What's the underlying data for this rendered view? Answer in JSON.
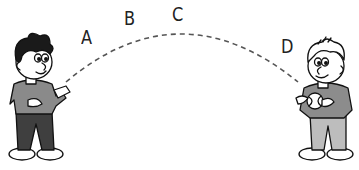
{
  "diagram": {
    "type": "trajectory-illustration",
    "labels": [
      {
        "id": "A",
        "text": "A",
        "x": 81,
        "y": 28
      },
      {
        "id": "B",
        "text": "B",
        "x": 124,
        "y": 9
      },
      {
        "id": "C",
        "text": "C",
        "x": 172,
        "y": 5
      },
      {
        "id": "D",
        "text": "D",
        "x": 281,
        "y": 37
      }
    ],
    "trajectory": {
      "style": "dashed",
      "color": "#555555",
      "start": [
        66,
        82
      ],
      "peak": [
        182,
        33
      ],
      "end": [
        298,
        82
      ]
    },
    "figures": [
      {
        "id": "left-boy",
        "hair": "dark",
        "shirt": "#888888",
        "pants": "#444444",
        "pose": "throwing"
      },
      {
        "id": "right-boy",
        "hair": "light",
        "shirt": "#8a8a8a",
        "pants": "#bbbbbb",
        "pose": "holding-ball"
      }
    ]
  }
}
